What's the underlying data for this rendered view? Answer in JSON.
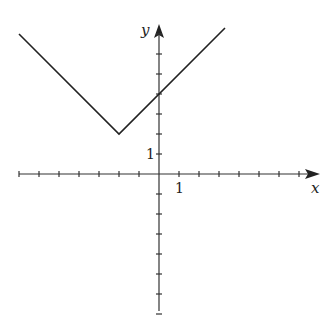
{
  "chart_data": {
    "type": "line",
    "title": "",
    "xlabel": "x",
    "ylabel": "y",
    "tick_labels": {
      "x": [
        "1"
      ],
      "y": [
        "1"
      ]
    },
    "xlim": [
      -7,
      3.3
    ],
    "ylim": [
      -7,
      7.3
    ],
    "grid": false,
    "legend": null,
    "series": [
      {
        "name": "y = |x + 2| + 2",
        "x": [
          -7,
          -2,
          3.3
        ],
        "y": [
          7,
          2,
          7.3
        ]
      }
    ],
    "annotations": {
      "vertex": [
        -2,
        2
      ],
      "y_intercept": 4
    },
    "x_ticks": [
      -7,
      -6,
      -5,
      -4,
      -3,
      -2,
      -1,
      1,
      2,
      3,
      4,
      5,
      6,
      7
    ],
    "y_ticks": [
      -7,
      -6,
      -5,
      -4,
      -3,
      -2,
      -1,
      1,
      2,
      3,
      4,
      5,
      6,
      7
    ]
  },
  "labels": {
    "x_axis": "x",
    "y_axis": "y",
    "x_one": "1",
    "y_one": "1"
  }
}
